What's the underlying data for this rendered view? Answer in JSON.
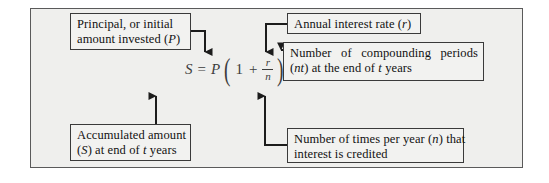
{
  "figure": {
    "frame_color": "#5a5a5a",
    "background": "#efefed",
    "box_border": "#3a3a3a",
    "wire_color": "#1c1c1c"
  },
  "formula": {
    "lhs": "S",
    "equals": "=",
    "principal": "P",
    "open_paren": "(",
    "one": "1",
    "plus": "+",
    "frac_numerator": "r",
    "frac_denominator": "n",
    "close_paren": ")",
    "exponent": "nt",
    "plain": "S = P(1 + r/n)^(nt)"
  },
  "callouts": [
    {
      "id": "principal",
      "line1": "Principal, or initial",
      "line2": "amount invested (P)"
    },
    {
      "id": "annual-interest-rate",
      "line1": "Annual interest rate (r)"
    },
    {
      "id": "compounding-periods",
      "line1": "Number of compounding periods",
      "line2": "(nt) at the end of t years"
    },
    {
      "id": "accumulated-amount",
      "line1": "Accumulated amount",
      "line2": "(S) at end of t years"
    },
    {
      "id": "times-per-year",
      "line1": "Number of times per year (n) that",
      "line2": "interest is credited"
    }
  ]
}
